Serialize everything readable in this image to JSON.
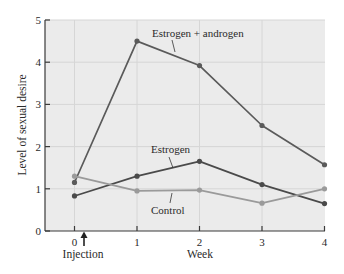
{
  "chart_data": {
    "type": "line",
    "title": "",
    "xlabel": "Week",
    "ylabel": "Level of sexual desire",
    "x": [
      0,
      1,
      2,
      3,
      4
    ],
    "xticks": [
      "0",
      "1",
      "2",
      "3",
      "4"
    ],
    "yticks": [
      "0",
      "1",
      "2",
      "3",
      "4",
      "5"
    ],
    "xlim": [
      -0.45,
      4
    ],
    "ylim": [
      0,
      5
    ],
    "grid": true,
    "legend_position": "inline labels",
    "series": [
      {
        "name": "Estrogen + androgen",
        "values": [
          1.15,
          4.5,
          3.92,
          2.5,
          1.57
        ],
        "color": "#5a5a5a"
      },
      {
        "name": "Estrogen",
        "values": [
          0.83,
          1.3,
          1.65,
          1.1,
          0.65
        ],
        "color": "#4a4a4a"
      },
      {
        "name": "Control",
        "values": [
          1.3,
          0.95,
          0.97,
          0.66,
          1.0
        ],
        "color": "#9a9a9a"
      }
    ],
    "annotations": [
      {
        "text": "Injection",
        "x": 0.15,
        "arrow": "up",
        "position": "below x-axis"
      }
    ]
  },
  "colors": {
    "plot_background": "#ebebeb",
    "grid": "#d6d6d6",
    "axis": "#3a3a3a",
    "text": "#2a2a2a"
  }
}
